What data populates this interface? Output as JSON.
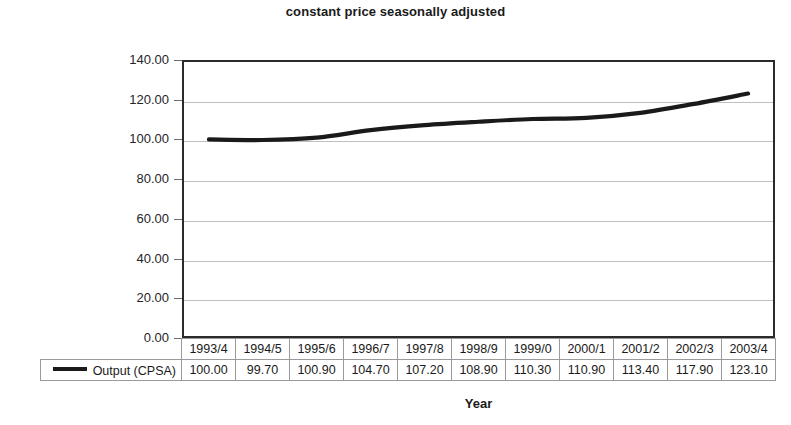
{
  "chart_data": {
    "type": "line",
    "title": "constant price seasonally adjusted",
    "xlabel": "Year",
    "ylabel": "Index (1993 = 100)",
    "categories": [
      "1993/4",
      "1994/5",
      "1995/6",
      "1996/7",
      "1997/8",
      "1998/9",
      "1999/0",
      "2000/1",
      "2001/2",
      "2002/3",
      "2003/4"
    ],
    "series": [
      {
        "name": "Output (CPSA)",
        "values": [
          100.0,
          99.7,
          100.9,
          104.7,
          107.2,
          108.9,
          110.3,
          110.9,
          113.4,
          117.9,
          123.1
        ],
        "color": "#1a1a1a"
      }
    ],
    "ylim": [
      0,
      140
    ],
    "ytick_step": 20,
    "ytick_labels": [
      "140.00",
      "120.00",
      "100.00",
      "80.00",
      "60.00",
      "40.00",
      "20.00",
      "0.00"
    ],
    "ytick_values": [
      140,
      120,
      100,
      80,
      60,
      40,
      20,
      0
    ],
    "grid": true,
    "legend_position": "data-table-left",
    "value_format": "0.00"
  },
  "table": {
    "value_row_labels": [
      "Output (CPSA)"
    ],
    "header_cells": [
      "1993/4",
      "1994/5",
      "1995/6",
      "1996/7",
      "1997/8",
      "1998/9",
      "1999/0",
      "2000/1",
      "2001/2",
      "2002/3",
      "2003/4"
    ],
    "value_cells": [
      "100.00",
      "99.70",
      "100.90",
      "104.70",
      "107.20",
      "108.90",
      "110.30",
      "110.90",
      "113.40",
      "117.90",
      "123.10"
    ]
  },
  "colors": {
    "series_line": "#1a1a1a",
    "axis": "#2b2b2b",
    "gridline": "#bfbfbf",
    "table_border": "#9a9a9a",
    "background": "#ffffff",
    "text": "#1a1a1a"
  }
}
